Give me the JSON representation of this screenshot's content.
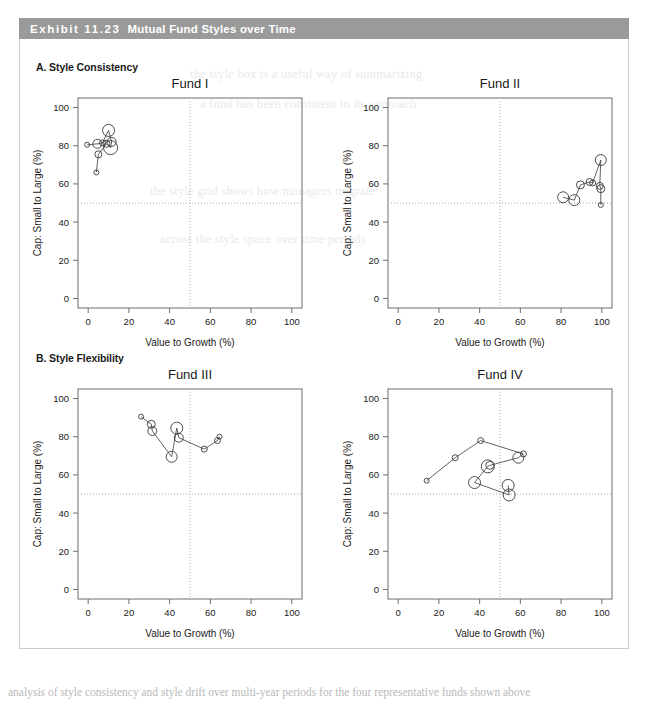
{
  "banner": {
    "exhibit_number": "Exhibit 11.23",
    "title": "Mutual Fund Styles over Time"
  },
  "panels": [
    {
      "label": "A. Style Consistency"
    },
    {
      "label": "B. Style Flexibility"
    }
  ],
  "axis": {
    "xlabel": "Value to Growth (%)",
    "ylabel": "Cap: Small to Large (%)",
    "xticks": [
      "0",
      "20",
      "40",
      "60",
      "80",
      "100"
    ],
    "yticks": [
      "0",
      "20",
      "40",
      "60",
      "80",
      "100"
    ],
    "reference_x": "50",
    "reference_y": "50"
  },
  "colors": {
    "banner": "#9a9a9a",
    "banner_text": "#ffffff",
    "frame": "#6e6e6e",
    "marker": "#3a3a3a",
    "grid": "#a9a9a9",
    "card_border": "#c9c9c9"
  },
  "chart_data": [
    {
      "type": "scatter",
      "title": "Fund I",
      "xlabel": "Value to Growth (%)",
      "ylabel": "Cap: Small to Large (%)",
      "xlim": [
        -5,
        105
      ],
      "ylim": [
        -5,
        105
      ],
      "xticks": [
        0,
        20,
        40,
        60,
        80,
        100
      ],
      "yticks": [
        0,
        20,
        40,
        60,
        80,
        100
      ],
      "grid": false,
      "reference_lines": {
        "x": 50,
        "y": 50
      },
      "connected": true,
      "points": [
        {
          "x": -0.5,
          "y": 80.5,
          "size": 2.5
        },
        {
          "x": 4.5,
          "y": 81.0,
          "size": 4.5
        },
        {
          "x": 7.0,
          "y": 81.5,
          "size": 3.0
        },
        {
          "x": 10.0,
          "y": 88.0,
          "size": 6.0
        },
        {
          "x": 11.5,
          "y": 82.0,
          "size": 4.5
        },
        {
          "x": 11.0,
          "y": 79.0,
          "size": 7.0
        },
        {
          "x": 9.0,
          "y": 81.0,
          "size": 3.5
        },
        {
          "x": 5.0,
          "y": 75.5,
          "size": 3.5
        },
        {
          "x": 4.0,
          "y": 66.0,
          "size": 2.5
        }
      ]
    },
    {
      "type": "scatter",
      "title": "Fund II",
      "xlabel": "Value to Growth (%)",
      "ylabel": "Cap: Small to Large (%)",
      "xlim": [
        -5,
        105
      ],
      "ylim": [
        -5,
        105
      ],
      "xticks": [
        0,
        20,
        40,
        60,
        80,
        100
      ],
      "yticks": [
        0,
        20,
        40,
        60,
        80,
        100
      ],
      "grid": false,
      "reference_lines": {
        "x": 50,
        "y": 50
      },
      "connected": true,
      "points": [
        {
          "x": 81.0,
          "y": 53.0,
          "size": 5.5
        },
        {
          "x": 86.5,
          "y": 51.5,
          "size": 5.5
        },
        {
          "x": 89.5,
          "y": 59.5,
          "size": 4.0
        },
        {
          "x": 94.0,
          "y": 61.0,
          "size": 3.5
        },
        {
          "x": 95.5,
          "y": 60.5,
          "size": 3.0
        },
        {
          "x": 99.5,
          "y": 72.5,
          "size": 5.5
        },
        {
          "x": 99.0,
          "y": 59.0,
          "size": 3.5
        },
        {
          "x": 99.5,
          "y": 57.5,
          "size": 4.0
        },
        {
          "x": 99.5,
          "y": 49.0,
          "size": 2.5
        }
      ]
    },
    {
      "type": "scatter",
      "title": "Fund III",
      "xlabel": "Value to Growth (%)",
      "ylabel": "Cap: Small to Large (%)",
      "xlim": [
        -5,
        105
      ],
      "ylim": [
        -5,
        105
      ],
      "xticks": [
        0,
        20,
        40,
        60,
        80,
        100
      ],
      "yticks": [
        0,
        20,
        40,
        60,
        80,
        100
      ],
      "grid": false,
      "reference_lines": {
        "x": 50,
        "y": 50
      },
      "connected": true,
      "points": [
        {
          "x": 26.0,
          "y": 90.5,
          "size": 2.5
        },
        {
          "x": 31.0,
          "y": 86.5,
          "size": 4.0
        },
        {
          "x": 31.5,
          "y": 83.0,
          "size": 4.5
        },
        {
          "x": 41.0,
          "y": 69.5,
          "size": 5.5
        },
        {
          "x": 43.5,
          "y": 84.5,
          "size": 6.0
        },
        {
          "x": 44.5,
          "y": 79.5,
          "size": 4.5
        },
        {
          "x": 57.0,
          "y": 73.5,
          "size": 3.0
        },
        {
          "x": 63.5,
          "y": 78.0,
          "size": 3.0
        },
        {
          "x": 64.5,
          "y": 80.0,
          "size": 2.5
        }
      ]
    },
    {
      "type": "scatter",
      "title": "Fund IV",
      "xlabel": "Value to Growth (%)",
      "ylabel": "Cap: Small to Large (%)",
      "xlim": [
        -5,
        105
      ],
      "ylim": [
        -5,
        105
      ],
      "xticks": [
        0,
        20,
        40,
        60,
        80,
        100
      ],
      "yticks": [
        0,
        20,
        40,
        60,
        80,
        100
      ],
      "grid": false,
      "reference_lines": {
        "x": 50,
        "y": 50
      },
      "connected": true,
      "points": [
        {
          "x": 14.0,
          "y": 57.0,
          "size": 2.5
        },
        {
          "x": 28.0,
          "y": 69.0,
          "size": 3.0
        },
        {
          "x": 40.5,
          "y": 78.0,
          "size": 3.0
        },
        {
          "x": 61.5,
          "y": 71.0,
          "size": 3.0
        },
        {
          "x": 59.0,
          "y": 69.0,
          "size": 5.5
        },
        {
          "x": 45.0,
          "y": 65.0,
          "size": 4.0
        },
        {
          "x": 44.0,
          "y": 64.5,
          "size": 6.5
        },
        {
          "x": 37.5,
          "y": 56.0,
          "size": 6.0
        },
        {
          "x": 54.5,
          "y": 49.5,
          "size": 6.0
        },
        {
          "x": 54.0,
          "y": 54.5,
          "size": 6.0
        }
      ]
    }
  ],
  "ghost_text": {
    "lines": [
      "the style box is a useful way of summarizing",
      "a fund has been consistent in its approach",
      "the style grid shows how managers migrate",
      "across the style space over time periods"
    ],
    "footer": "analysis of style consistency and style drift over multi-year periods for the four representative funds shown above"
  }
}
